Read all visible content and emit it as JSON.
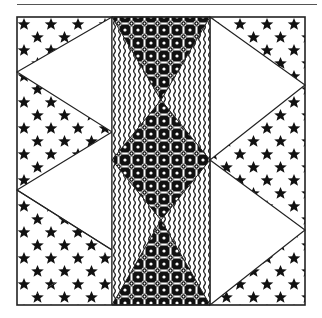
{
  "figure": {
    "type": "quilt-block-illustration",
    "colors": {
      "ink": "#111111",
      "paper": "#ffffff",
      "line": "#222222"
    },
    "fabrics": [
      {
        "name": "star-print",
        "description": "black stars on white"
      },
      {
        "name": "plain-white",
        "description": "solid white"
      },
      {
        "name": "floral-lattice",
        "description": "black with white lattice and circular flower motifs"
      },
      {
        "name": "wavy-stripe",
        "description": "white with black wavy vertical lines"
      }
    ]
  }
}
